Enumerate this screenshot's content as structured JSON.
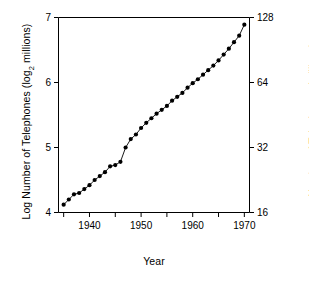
{
  "chart_data": {
    "type": "line",
    "title": "",
    "xlabel": "Year",
    "ylabel": "Log Number of Telephones (log2 millions)",
    "ylabel_right": "Number of Telephones (millions)",
    "xlim": [
      1934,
      1971
    ],
    "ylim": [
      4,
      7
    ],
    "grid": false,
    "legend": false,
    "marker": "filled-circle",
    "line_style": "solid",
    "color": "#000000",
    "x_ticks": [
      1935,
      1940,
      1945,
      1950,
      1955,
      1960,
      1965,
      1970
    ],
    "x_tick_labels": [
      "",
      "1940",
      "",
      "1950",
      "",
      "1960",
      "",
      "1970"
    ],
    "y_ticks": [
      4,
      5,
      6,
      7
    ],
    "y_tick_labels": [
      "4",
      "5",
      "6",
      "7"
    ],
    "y_ticks_right": [
      4,
      5,
      6,
      7
    ],
    "y_tick_labels_right": [
      "16",
      "32",
      "64",
      "128"
    ],
    "x": [
      1935,
      1936,
      1937,
      1938,
      1939,
      1940,
      1941,
      1942,
      1943,
      1944,
      1945,
      1946,
      1947,
      1948,
      1949,
      1950,
      1951,
      1952,
      1953,
      1954,
      1955,
      1956,
      1957,
      1958,
      1959,
      1960,
      1961,
      1962,
      1963,
      1964,
      1965,
      1966,
      1967,
      1968,
      1969,
      1970
    ],
    "values": [
      4.12,
      4.2,
      4.28,
      4.3,
      4.36,
      4.42,
      4.5,
      4.56,
      4.62,
      4.71,
      4.73,
      4.78,
      5.0,
      5.13,
      5.2,
      5.3,
      5.38,
      5.45,
      5.52,
      5.58,
      5.64,
      5.72,
      5.78,
      5.84,
      5.92,
      5.99,
      6.05,
      6.12,
      6.19,
      6.26,
      6.34,
      6.43,
      6.52,
      6.62,
      6.72,
      6.89
    ],
    "values_millions": [
      17.4,
      18.4,
      19.4,
      19.7,
      20.5,
      21.4,
      22.6,
      23.6,
      24.6,
      26.2,
      26.5,
      27.5,
      32.0,
      35.0,
      36.8,
      39.4,
      41.6,
      43.7,
      45.9,
      47.9,
      49.9,
      52.7,
      55.0,
      57.3,
      60.6,
      63.6,
      66.3,
      69.5,
      72.9,
      76.6,
      81.0,
      86.2,
      91.8,
      98.3,
      105.4,
      118.7
    ]
  }
}
